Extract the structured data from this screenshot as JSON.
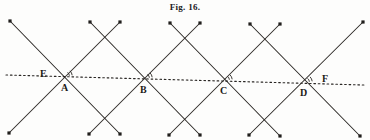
{
  "figure": {
    "caption": "Fig. 16.",
    "width": 370,
    "height": 140,
    "background_color": "#fdfdfc",
    "ink_color": "#2a2724",
    "labels": [
      {
        "text": "E",
        "x": 40,
        "y": 69
      },
      {
        "text": "A",
        "x": 61,
        "y": 83
      },
      {
        "text": "B",
        "x": 140,
        "y": 85
      },
      {
        "text": "C",
        "x": 220,
        "y": 86
      },
      {
        "text": "D",
        "x": 300,
        "y": 88
      },
      {
        "text": "F",
        "x": 322,
        "y": 74
      }
    ],
    "transversal": {
      "name": "line-EF",
      "style": "dotted",
      "x1": 6,
      "y1": 75,
      "x2": 364,
      "y2": 85
    },
    "intersections": [
      {
        "label": "A",
        "x": 65,
        "y": 76
      },
      {
        "label": "B",
        "x": 145,
        "y": 78
      },
      {
        "label": "C",
        "x": 225,
        "y": 80
      },
      {
        "label": "D",
        "x": 305,
        "y": 82
      }
    ],
    "crossing_lines": {
      "description": "Four X shaped crossings formed by two families of parallel oblique lines",
      "down_right_lines": [
        {
          "x1": 10,
          "y1": 21,
          "x2": 120,
          "y2": 134
        },
        {
          "x1": 90,
          "y1": 22,
          "x2": 200,
          "y2": 135
        },
        {
          "x1": 170,
          "y1": 23,
          "x2": 280,
          "y2": 136
        },
        {
          "x1": 250,
          "y1": 24,
          "x2": 360,
          "y2": 136
        }
      ],
      "down_left_lines": [
        {
          "x1": 120,
          "y1": 22,
          "x2": 9,
          "y2": 133
        },
        {
          "x1": 200,
          "y1": 23,
          "x2": 89,
          "y2": 134
        },
        {
          "x1": 280,
          "y1": 24,
          "x2": 169,
          "y2": 135
        },
        {
          "x1": 363,
          "y1": 22,
          "x2": 249,
          "y2": 135
        }
      ]
    },
    "endpoint_dots": [
      {
        "x": 10,
        "y": 21
      },
      {
        "x": 90,
        "y": 22
      },
      {
        "x": 170,
        "y": 23
      },
      {
        "x": 250,
        "y": 24
      },
      {
        "x": 120,
        "y": 22
      },
      {
        "x": 200,
        "y": 23
      },
      {
        "x": 280,
        "y": 24
      },
      {
        "x": 363,
        "y": 22
      },
      {
        "x": 120,
        "y": 134
      },
      {
        "x": 200,
        "y": 135
      },
      {
        "x": 280,
        "y": 136
      },
      {
        "x": 360,
        "y": 136
      },
      {
        "x": 9,
        "y": 133
      },
      {
        "x": 89,
        "y": 134
      },
      {
        "x": 169,
        "y": 135
      },
      {
        "x": 249,
        "y": 135
      }
    ],
    "angle_arcs": [
      {
        "at": "A",
        "cx": 65,
        "cy": 76
      },
      {
        "at": "B",
        "cx": 145,
        "cy": 78
      },
      {
        "at": "C",
        "cx": 225,
        "cy": 80
      },
      {
        "at": "D",
        "cx": 305,
        "cy": 82
      }
    ]
  }
}
